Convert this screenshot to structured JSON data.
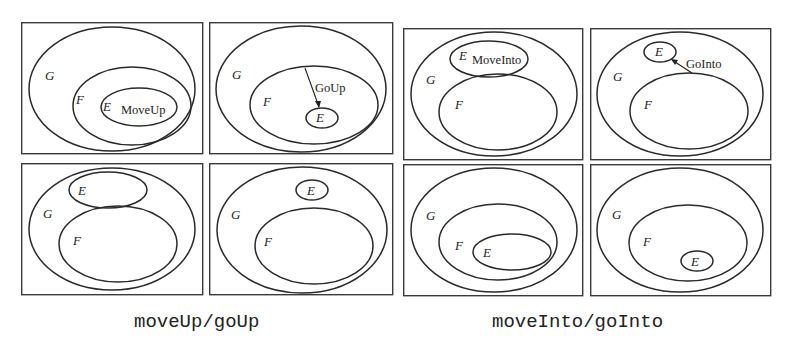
{
  "figure": {
    "groups": [
      {
        "caption": "moveUp/goUp",
        "panels": [
          {
            "position": "top-left",
            "labels": {
              "G": "G",
              "F": "F",
              "E": "E"
            },
            "operation": "MoveUp",
            "description": "E nested inside F inside G"
          },
          {
            "position": "top-right",
            "labels": {
              "G": "G",
              "F": "F",
              "E": "E"
            },
            "operation": "GoUp",
            "description": "small E inside F inside G with arrow from F boundary to E"
          },
          {
            "position": "bottom-left",
            "labels": {
              "G": "G",
              "F": "F",
              "E": "E"
            },
            "operation": "",
            "description": "E and F siblings inside G"
          },
          {
            "position": "bottom-right",
            "labels": {
              "G": "G",
              "F": "F",
              "E": "E"
            },
            "operation": "",
            "description": "small E and F siblings inside G"
          }
        ]
      },
      {
        "caption": "moveInto/goInto",
        "panels": [
          {
            "position": "top-left",
            "labels": {
              "G": "G",
              "F": "F",
              "E": "E"
            },
            "operation": "MoveInto",
            "description": "E and F siblings inside G"
          },
          {
            "position": "top-right",
            "labels": {
              "G": "G",
              "F": "F",
              "E": "E"
            },
            "operation": "GoInto",
            "description": "small E and F siblings inside G with arrow from F to E"
          },
          {
            "position": "bottom-left",
            "labels": {
              "G": "G",
              "F": "F",
              "E": "E"
            },
            "operation": "",
            "description": "E nested inside F inside G"
          },
          {
            "position": "bottom-right",
            "labels": {
              "G": "G",
              "F": "F",
              "E": "E"
            },
            "operation": "",
            "description": "small E nested inside F inside G"
          }
        ]
      }
    ]
  }
}
